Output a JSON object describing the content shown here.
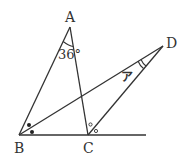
{
  "diagram": {
    "vertices": {
      "A": {
        "label": "A",
        "x": 70,
        "y": 27
      },
      "B": {
        "label": "B",
        "x": 19,
        "y": 135
      },
      "C": {
        "label": "C",
        "x": 88,
        "y": 135
      },
      "D": {
        "label": "D",
        "x": 163,
        "y": 46
      }
    },
    "baseline_end": {
      "x": 146,
      "y": 135
    },
    "angle_A_label": "36°",
    "angle_D_label": "ア",
    "angle_B_mark": "bisected (dots)",
    "angle_C_mark": "bisected (circles)",
    "line_color": "#333333"
  }
}
